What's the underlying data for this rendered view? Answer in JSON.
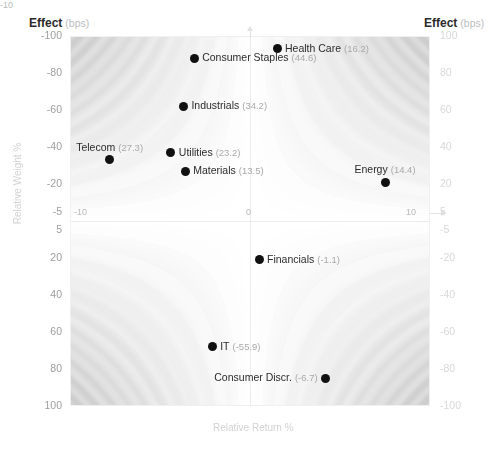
{
  "header": {
    "left_title": "Effect",
    "left_unit": "(bps)",
    "right_title": "Effect",
    "right_unit": "(bps)"
  },
  "axes": {
    "y_left_label": "Relative Weight %",
    "x_bottom_label": "Relative Return %",
    "x_bottom_extra_tick": "-10",
    "y_left_ticks": [
      "-100",
      "-80",
      "-60",
      "-40",
      "-20",
      "-5",
      "5",
      "20",
      "40",
      "60",
      "80",
      "100"
    ],
    "y_right_ticks": [
      "100",
      "80",
      "60",
      "40",
      "20",
      "5",
      "-5",
      "-20",
      "-40",
      "-60",
      "-80",
      "-100"
    ],
    "x_ticks": [
      "-10",
      "0",
      "10"
    ]
  },
  "chart_data": {
    "type": "scatter",
    "xlabel": "Relative Return %",
    "ylabel": "Relative Weight %",
    "xlim": [
      -10,
      10
    ],
    "ylim": [
      -5,
      100
    ],
    "y_axis_inverted": true,
    "grid": false,
    "legend": "none",
    "background": "contour-shaded attribution surface",
    "zlabel": "Effect (bps)",
    "z_scale_left": [
      -100,
      -80,
      -60,
      -40,
      -20,
      -5,
      5,
      20,
      40,
      60,
      80,
      100
    ],
    "z_scale_right": [
      100,
      80,
      60,
      40,
      20,
      5,
      -5,
      -20,
      -40,
      -60,
      -80,
      -100
    ],
    "points": [
      {
        "name": "Consumer Discr.",
        "effect_bps": -6.7,
        "label": "Consumer Discr.",
        "value_text": "(-6.7)",
        "x": 4.2,
        "y": -85,
        "label_side": "left"
      },
      {
        "name": "IT",
        "effect_bps": -55.9,
        "label": "IT",
        "value_text": "(-55.9)",
        "x": -2.1,
        "y": -68,
        "label_side": "right"
      },
      {
        "name": "Health Care",
        "effect_bps": 16.2,
        "label": "Health Care",
        "value_text": "(16.2)",
        "x": 1.5,
        "y": 93,
        "label_side": "right"
      },
      {
        "name": "Energy",
        "effect_bps": 14.4,
        "label": "Energy",
        "value_text": "(14.4)",
        "x": 7.5,
        "y": 21,
        "label_side": "above"
      },
      {
        "name": "Financials",
        "effect_bps": -1.1,
        "label": "Financials",
        "value_text": "(-1.1)",
        "x": 0.5,
        "y": -21,
        "label_side": "right"
      },
      {
        "name": "Telecom",
        "effect_bps": 27.3,
        "label": "Telecom",
        "value_text": "(27.3)",
        "x": -7.8,
        "y": 33,
        "label_side": "above"
      },
      {
        "name": "Materials",
        "effect_bps": 13.5,
        "label": "Materials",
        "value_text": "(13.5)",
        "x": -3.6,
        "y": 27,
        "label_side": "right"
      },
      {
        "name": "Utilities",
        "effect_bps": 23.2,
        "label": "Utilities",
        "value_text": "(23.2)",
        "x": -4.4,
        "y": 37,
        "label_side": "right"
      },
      {
        "name": "Industrials",
        "effect_bps": 34.2,
        "label": "Industrials",
        "value_text": "(34.2)",
        "x": -3.7,
        "y": 62,
        "label_side": "right"
      },
      {
        "name": "Consumer Staples",
        "effect_bps": 44.6,
        "label": "Consumer Staples",
        "value_text": "(44.6)",
        "x": -3.1,
        "y": 88,
        "label_side": "right"
      }
    ]
  }
}
